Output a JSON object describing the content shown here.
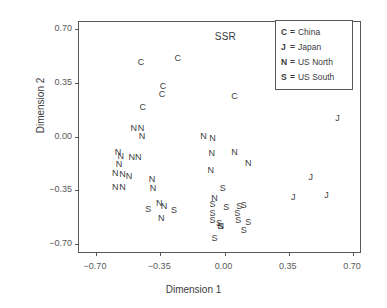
{
  "chart_data": {
    "type": "scatter",
    "title": "",
    "xlabel": "Dimension 1",
    "ylabel": "Dimension 2",
    "xlim": [
      -0.7,
      0.7
    ],
    "ylim": [
      -0.7,
      0.7
    ],
    "xticks": [
      -0.7,
      -0.35,
      0.0,
      0.35,
      0.7
    ],
    "yticks": [
      -0.7,
      -0.35,
      0.0,
      0.35,
      0.7
    ],
    "xticklabels": [
      "−0.70",
      "−0.35",
      "0.00",
      "0.35",
      "0.70"
    ],
    "yticklabels": [
      "−0.70",
      "−0.35",
      "0.00",
      "0.35",
      "0.70"
    ],
    "grid": false,
    "legend_position": "top-right",
    "annotations": [
      {
        "text": "SSR",
        "x": 0.005,
        "y": 0.655
      }
    ],
    "series": [
      {
        "name": "China",
        "marker": "C",
        "points": [
          {
            "x": -0.455,
            "y": 0.485
          },
          {
            "x": -0.255,
            "y": 0.51
          },
          {
            "x": -0.335,
            "y": 0.33
          },
          {
            "x": -0.34,
            "y": 0.275
          },
          {
            "x": -0.445,
            "y": 0.19
          },
          {
            "x": 0.055,
            "y": 0.265
          }
        ]
      },
      {
        "name": "Japan",
        "marker": "J",
        "points": [
          {
            "x": 0.615,
            "y": 0.12
          },
          {
            "x": 0.47,
            "y": -0.265
          },
          {
            "x": 0.375,
            "y": -0.395
          },
          {
            "x": 0.555,
            "y": -0.38
          }
        ]
      },
      {
        "name": "US North",
        "marker": "N",
        "points": [
          {
            "x": -0.495,
            "y": 0.055
          },
          {
            "x": -0.455,
            "y": 0.055
          },
          {
            "x": -0.45,
            "y": 0.005
          },
          {
            "x": -0.58,
            "y": -0.1
          },
          {
            "x": -0.565,
            "y": -0.13
          },
          {
            "x": -0.505,
            "y": -0.135
          },
          {
            "x": -0.47,
            "y": -0.135
          },
          {
            "x": -0.575,
            "y": -0.18
          },
          {
            "x": -0.595,
            "y": -0.235
          },
          {
            "x": -0.555,
            "y": -0.245
          },
          {
            "x": -0.52,
            "y": -0.255
          },
          {
            "x": -0.595,
            "y": -0.33
          },
          {
            "x": -0.555,
            "y": -0.33
          },
          {
            "x": -0.395,
            "y": -0.275
          },
          {
            "x": -0.39,
            "y": -0.335
          },
          {
            "x": -0.115,
            "y": 0.005
          },
          {
            "x": -0.065,
            "y": -0.01
          },
          {
            "x": -0.07,
            "y": -0.105
          },
          {
            "x": 0.055,
            "y": -0.1
          },
          {
            "x": 0.13,
            "y": -0.175
          },
          {
            "x": -0.075,
            "y": -0.215
          },
          {
            "x": -0.055,
            "y": -0.4
          },
          {
            "x": -0.33,
            "y": -0.455
          },
          {
            "x": -0.355,
            "y": -0.43
          },
          {
            "x": -0.345,
            "y": -0.53
          },
          {
            "x": -0.02,
            "y": -0.585
          }
        ]
      },
      {
        "name": "US South",
        "marker": "S",
        "points": [
          {
            "x": -0.01,
            "y": -0.335
          },
          {
            "x": -0.065,
            "y": -0.44
          },
          {
            "x": -0.065,
            "y": -0.495
          },
          {
            "x": -0.065,
            "y": -0.545
          },
          {
            "x": -0.03,
            "y": -0.565
          },
          {
            "x": -0.055,
            "y": -0.66
          },
          {
            "x": -0.415,
            "y": -0.47
          },
          {
            "x": -0.275,
            "y": -0.48
          },
          {
            "x": 0.01,
            "y": -0.46
          },
          {
            "x": 0.08,
            "y": -0.45
          },
          {
            "x": 0.105,
            "y": -0.445
          },
          {
            "x": 0.07,
            "y": -0.5
          },
          {
            "x": 0.075,
            "y": -0.545
          },
          {
            "x": 0.13,
            "y": -0.555
          },
          {
            "x": 0.105,
            "y": -0.61
          },
          {
            "x": -0.02,
            "y": -0.58
          }
        ]
      }
    ]
  },
  "legend": {
    "items": [
      {
        "key": "C",
        "eq": "=",
        "label": "China"
      },
      {
        "key": "J",
        "eq": "=",
        "label": "Japan"
      },
      {
        "key": "N",
        "eq": "=",
        "label": "US North"
      },
      {
        "key": "S",
        "eq": "=",
        "label": "US South"
      }
    ]
  }
}
